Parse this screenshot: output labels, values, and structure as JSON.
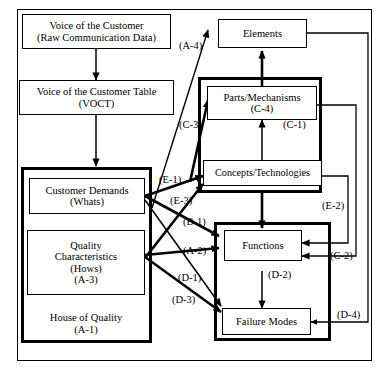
{
  "diagram": {
    "title_region": "Quality Function Deployment linkage diagram",
    "outer_frame_name": "outer-frame",
    "boxes": {
      "voc": {
        "line1": "Voice of the Customer",
        "line2": "(Raw Communication Data)"
      },
      "voct": {
        "line1": "Voice of the Customer Table",
        "line2": "(VOCT)"
      },
      "demands": {
        "line1": "Customer Demands",
        "line2": "(Whats)"
      },
      "quality": {
        "line1": "Quality",
        "line2": "Characteristics",
        "line3": "(Hows)",
        "line4": "(A-3)"
      },
      "hoq": {
        "line1": "House of Quality",
        "line2": "(A-1)"
      },
      "elements": {
        "line1": "Elements"
      },
      "parts": {
        "line1": "Parts/Mechanisms",
        "line2": "(C-4)"
      },
      "concepts": {
        "line1": "Concepts/Technologies"
      },
      "functions": {
        "line1": "Functions"
      },
      "failure": {
        "line1": "Failure Modes"
      }
    },
    "edge_labels": {
      "a4": "(A-4)",
      "c3": "(C-3)",
      "c1": "(C-1)",
      "e1": "(E-1)",
      "e3": "(E-3)",
      "b1": "(B-1)",
      "a2": "(A-2)",
      "d1": "(D-1)",
      "d3": "(D-3)",
      "e2": "(E-2)",
      "c2": "(C-2)",
      "d2": "(D-2)",
      "d4": "(D-4)"
    },
    "colors": {
      "stroke": "#000000",
      "background": "#ffffff"
    }
  }
}
